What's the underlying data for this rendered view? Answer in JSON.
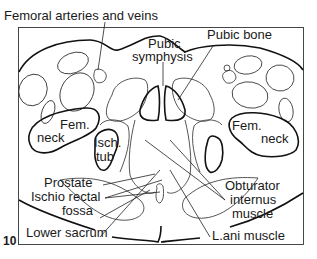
{
  "figure": {
    "number": "10"
  },
  "labels": {
    "femoral_vessels": "Femoral arteries and veins",
    "pubic_bone": "Pubic bone",
    "pubic_symphysis_1": "Pubic",
    "pubic_symphysis_2": "symphysis",
    "fem_neck_left_1": "Fem.",
    "fem_neck_left_2": "neck",
    "fem_neck_right_1": "Fem.",
    "fem_neck_right_2": "neck",
    "isch_tub_1": "Isch.",
    "isch_tub_2": "tub",
    "prostate": "Prostate",
    "ischio_rectal_1": "Ischio rectal",
    "ischio_rectal_2": "fossa",
    "obturator_1": "Obturator",
    "obturator_2": "internus",
    "obturator_3": "muscle",
    "lower_sacrum": "Lower sacrum",
    "levator_ani": "L.ani muscle"
  }
}
